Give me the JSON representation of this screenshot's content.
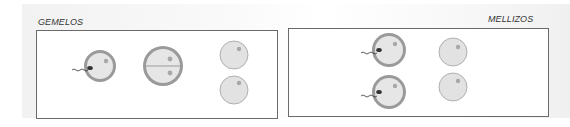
{
  "panels": {
    "left": {
      "title": "GEMELOS"
    },
    "right": {
      "title": "MELLIZOS"
    }
  },
  "colors": {
    "cell_fill": "#e6e6e6",
    "zona_ring": "#9a9a9a",
    "nucleus": "#a8a8a8",
    "sperm_head": "#333333",
    "panel_border": "#6a6a6a"
  }
}
